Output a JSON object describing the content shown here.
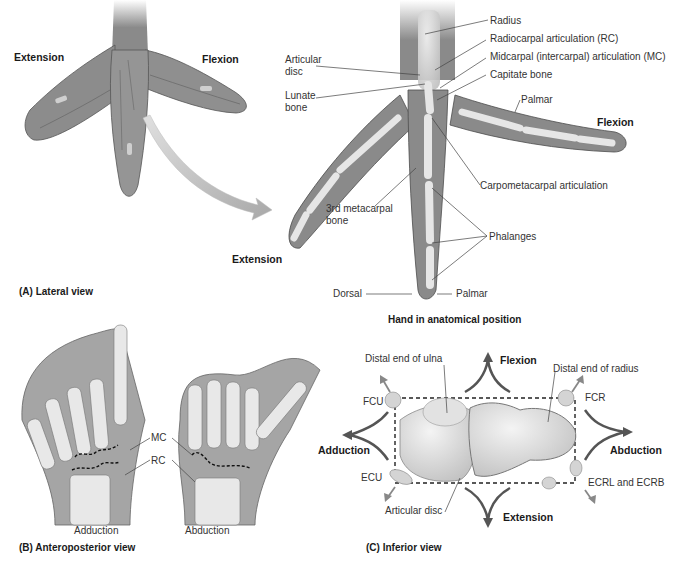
{
  "panel_a": {
    "caption": "(A) Lateral view",
    "left_hand": {
      "extension": "Extension",
      "flexion": "Flexion"
    },
    "right_hand": {
      "title": "Hand in anatomical position",
      "labels": {
        "radius": "Radius",
        "radiocarpal": "Radiocarpal articulation (RC)",
        "midcarpal": "Midcarpal (intercarpal) articulation (MC)",
        "capitate": "Capitate bone",
        "palmar_top": "Palmar",
        "flexion": "Flexion",
        "articular_disc_1": "Articular",
        "articular_disc_2": "disc",
        "lunate_1": "Lunate",
        "lunate_2": "bone",
        "carpometacarpal": "Carpometacarpal articulation",
        "metacarpal_1": "3rd metacarpal",
        "metacarpal_2": "bone",
        "phalanges": "Phalanges",
        "extension": "Extension",
        "dorsal": "Dorsal",
        "palmar_bottom": "Palmar"
      }
    }
  },
  "panel_b": {
    "caption": "(B) Anteroposterior view",
    "mc": "MC",
    "rc": "RC",
    "left": "Adduction",
    "right": "Abduction"
  },
  "panel_c": {
    "caption": "(C) Inferior view",
    "distal_ulna": "Distal end of ulna",
    "distal_radius": "Distal end of radius",
    "flexion": "Flexion",
    "extension": "Extension",
    "adduction": "Adduction",
    "abduction": "Abduction",
    "fcu": "FCU",
    "fcr": "FCR",
    "ecu": "ECU",
    "ecrl": "ECRL and ECRB",
    "articular_disc": "Articular disc"
  }
}
